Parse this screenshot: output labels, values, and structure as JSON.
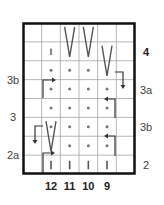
{
  "chart": {
    "title": "",
    "grid": {
      "cols": 6,
      "rows": 8,
      "x0": 23,
      "y0": 23,
      "x1": 135,
      "y1": 174
    },
    "left_labels": [
      {
        "text": "3b",
        "row": 3
      },
      {
        "text": "3",
        "row": 5
      },
      {
        "text": "2a",
        "row": 7
      }
    ],
    "right_labels": [
      {
        "text": "4",
        "row": 2,
        "bold": true
      },
      {
        "text": "3a",
        "row": 4
      },
      {
        "text": "3b",
        "row": 6
      },
      {
        "text": "2",
        "row": 8
      }
    ],
    "bottom_labels": [
      {
        "text": "12",
        "col": 1
      },
      {
        "text": "11",
        "col": 2
      },
      {
        "text": "10",
        "col": 3
      },
      {
        "text": "9",
        "col": 4
      }
    ],
    "symbols": [
      {
        "type": "bar-small",
        "col": 1,
        "row": 1
      },
      {
        "type": "v-tall",
        "col": 2,
        "row": 0,
        "span": 2
      },
      {
        "type": "v-tall",
        "col": 3,
        "row": 0,
        "span": 2
      },
      {
        "type": "v-tall",
        "col": 4,
        "row": 1,
        "span": 2
      },
      {
        "type": "dot",
        "col": 1,
        "row": 2
      },
      {
        "type": "dot",
        "col": 2,
        "row": 2
      },
      {
        "type": "dot",
        "col": 3,
        "row": 2
      },
      {
        "type": "dot",
        "col": 1,
        "row": 3
      },
      {
        "type": "dot",
        "col": 2,
        "row": 3
      },
      {
        "type": "dot",
        "col": 3,
        "row": 3
      },
      {
        "type": "dot",
        "col": 4,
        "row": 3
      },
      {
        "type": "dot",
        "col": 1,
        "row": 4
      },
      {
        "type": "dot",
        "col": 2,
        "row": 4
      },
      {
        "type": "dot",
        "col": 3,
        "row": 4
      },
      {
        "type": "dot",
        "col": 4,
        "row": 4
      },
      {
        "type": "dot",
        "col": 1,
        "row": 5
      },
      {
        "type": "dot",
        "col": 2,
        "row": 5
      },
      {
        "type": "dot",
        "col": 3,
        "row": 5
      },
      {
        "type": "dot",
        "col": 4,
        "row": 5
      },
      {
        "type": "v-tall",
        "col": 1,
        "row": 5,
        "span": 2
      },
      {
        "type": "dot",
        "col": 2,
        "row": 6
      },
      {
        "type": "dot",
        "col": 3,
        "row": 6
      },
      {
        "type": "dot",
        "col": 4,
        "row": 6
      },
      {
        "type": "bar",
        "col": 1,
        "row": 7
      },
      {
        "type": "bar",
        "col": 2,
        "row": 7
      },
      {
        "type": "bar",
        "col": 3,
        "row": 7
      },
      {
        "type": "bar",
        "col": 4,
        "row": 7
      }
    ],
    "colors": {
      "grid": "#999999",
      "frame": "#111111",
      "symbol": "#555555",
      "arrow": "#333333",
      "label": "#444444"
    }
  }
}
